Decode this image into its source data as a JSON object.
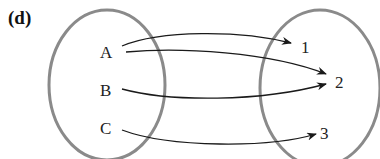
{
  "panel_label": "(d)",
  "domain_set": {
    "elements": [
      "A",
      "B",
      "C"
    ]
  },
  "codomain_set": {
    "elements": [
      "1",
      "2",
      "3"
    ]
  },
  "mappings": [
    {
      "from": "A",
      "to": "1"
    },
    {
      "from": "A",
      "to": "2"
    },
    {
      "from": "B",
      "to": "2"
    },
    {
      "from": "C",
      "to": "3"
    }
  ],
  "colors": {
    "ellipse": "#8a8a8a",
    "arrow": "#1a1a1a",
    "text": "#222222"
  }
}
